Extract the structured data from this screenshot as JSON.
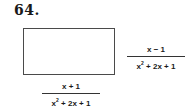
{
  "problem": {
    "number": "64."
  },
  "figure": {
    "shape": "rectangle",
    "width_label": {
      "numerator": "x + 1",
      "denominator_base": "x",
      "denominator_exp": "2",
      "denominator_rest": " + 2x + 1"
    },
    "height_label": {
      "numerator": "x − 1",
      "denominator_base": "x",
      "denominator_exp": "2",
      "denominator_rest": " + 2x + 1"
    }
  }
}
